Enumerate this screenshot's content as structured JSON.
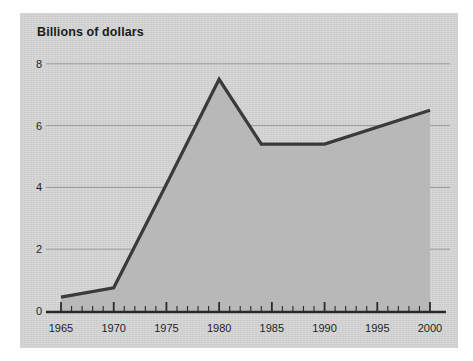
{
  "figure": {
    "panel_background": "#d6d6d6",
    "page_background": "#ffffff",
    "title": "Billions of dollars"
  },
  "chart_data": {
    "type": "area",
    "title": "Billions of dollars",
    "subtitle": "",
    "xlabel": "",
    "ylabel": "Billions of dollars",
    "x": [
      1965,
      1970,
      1975,
      1980,
      1984,
      1990,
      2000
    ],
    "values": [
      0.45,
      0.75,
      4.1,
      7.5,
      5.4,
      5.4,
      6.5
    ],
    "series": [
      {
        "name": "Billions of dollars",
        "x": [
          1965,
          1970,
          1975,
          1980,
          1984,
          1990,
          2000
        ],
        "values": [
          0.45,
          0.75,
          4.1,
          7.5,
          5.4,
          5.4,
          6.5
        ]
      }
    ],
    "xlim": [
      1964,
      2001
    ],
    "ylim": [
      0,
      8.6
    ],
    "x_tick_labels": [
      "1965",
      "1970",
      "1975",
      "1980",
      "1985",
      "1990",
      "1995",
      "2000"
    ],
    "x_ticks": [
      1965,
      1970,
      1975,
      1980,
      1985,
      1990,
      1995,
      2000
    ],
    "x_minor_tick_interval": 1,
    "y_tick_labels": [
      "0",
      "2",
      "4",
      "6",
      "8"
    ],
    "y_ticks": [
      0,
      2,
      4,
      6,
      8
    ],
    "grid": "horizontal",
    "legend": "none",
    "area_fill_color": "#b8b8b8",
    "line_color": "#3a3a3a",
    "gridline_color": "#9a9a9a",
    "axis_color": "#2a2a2a",
    "annotations": []
  },
  "axes": {
    "y_labels": [
      {
        "text": "8",
        "value": 8
      },
      {
        "text": "6",
        "value": 6
      },
      {
        "text": "4",
        "value": 4
      },
      {
        "text": "2",
        "value": 2
      },
      {
        "text": "0",
        "value": 0
      }
    ],
    "x_labels": [
      {
        "text": "1965",
        "value": 1965
      },
      {
        "text": "1970",
        "value": 1970
      },
      {
        "text": "1975",
        "value": 1975
      },
      {
        "text": "1980",
        "value": 1980
      },
      {
        "text": "1985",
        "value": 1985
      },
      {
        "text": "1990",
        "value": 1990
      },
      {
        "text": "1995",
        "value": 1995
      },
      {
        "text": "2000",
        "value": 2000
      }
    ]
  }
}
